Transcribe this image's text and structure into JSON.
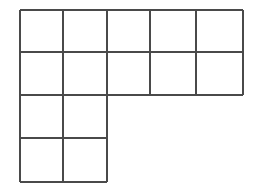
{
  "figure": {
    "shape_name": "L-shaped polyomino grid",
    "background_color": "#ffffff",
    "line_color": "#4a4a4a",
    "line_width": 1.6,
    "canvas": {
      "width": 266,
      "height": 192
    },
    "geometry": {
      "x_positions": [
        20,
        63,
        107,
        150,
        196,
        243
      ],
      "y_positions": [
        10,
        52,
        95,
        138,
        182
      ],
      "cell_width": 43,
      "cell_height": 43,
      "columns": 5,
      "rows": 4,
      "total_cells": 14
    },
    "rows": [
      {
        "index": 1,
        "y_top": 10,
        "y_bottom": 52,
        "columns_filled": 5,
        "x_start": 20,
        "x_end": 243
      },
      {
        "index": 2,
        "y_top": 52,
        "y_bottom": 95,
        "columns_filled": 5,
        "x_start": 20,
        "x_end": 243
      },
      {
        "index": 3,
        "y_top": 95,
        "y_bottom": 138,
        "columns_filled": 2,
        "x_start": 20,
        "x_end": 107
      },
      {
        "index": 4,
        "y_top": 138,
        "y_bottom": 182,
        "columns_filled": 2,
        "x_start": 20,
        "x_end": 107
      }
    ],
    "cells": [
      {
        "id": "r1c1",
        "x": 20,
        "y": 10,
        "w": 43,
        "h": 42
      },
      {
        "id": "r1c2",
        "x": 63,
        "y": 10,
        "w": 44,
        "h": 42
      },
      {
        "id": "r1c3",
        "x": 107,
        "y": 10,
        "w": 43,
        "h": 42
      },
      {
        "id": "r1c4",
        "x": 150,
        "y": 10,
        "w": 46,
        "h": 42
      },
      {
        "id": "r1c5",
        "x": 196,
        "y": 10,
        "w": 47,
        "h": 42
      },
      {
        "id": "r2c1",
        "x": 20,
        "y": 52,
        "w": 43,
        "h": 43
      },
      {
        "id": "r2c2",
        "x": 63,
        "y": 52,
        "w": 44,
        "h": 43
      },
      {
        "id": "r2c3",
        "x": 107,
        "y": 52,
        "w": 43,
        "h": 43
      },
      {
        "id": "r2c4",
        "x": 150,
        "y": 52,
        "w": 46,
        "h": 43
      },
      {
        "id": "r2c5",
        "x": 196,
        "y": 52,
        "w": 47,
        "h": 43
      },
      {
        "id": "r3c1",
        "x": 20,
        "y": 95,
        "w": 43,
        "h": 43
      },
      {
        "id": "r3c2",
        "x": 63,
        "y": 95,
        "w": 44,
        "h": 43
      },
      {
        "id": "r4c1",
        "x": 20,
        "y": 138,
        "w": 43,
        "h": 44
      },
      {
        "id": "r4c2",
        "x": 63,
        "y": 138,
        "w": 44,
        "h": 44
      }
    ],
    "segments": {
      "horizontal": [
        {
          "id": "h-top",
          "x1": 20,
          "x2": 243,
          "y": 10
        },
        {
          "id": "h-row1",
          "x1": 20,
          "x2": 243,
          "y": 52
        },
        {
          "id": "h-row2",
          "x1": 20,
          "x2": 243,
          "y": 95
        },
        {
          "id": "h-row3",
          "x1": 20,
          "x2": 107,
          "y": 138
        },
        {
          "id": "h-bottom",
          "x1": 20,
          "x2": 107,
          "y": 182
        }
      ],
      "vertical": [
        {
          "id": "v-left",
          "x": 20,
          "y1": 10,
          "y2": 182
        },
        {
          "id": "v-c1",
          "x": 63,
          "y1": 10,
          "y2": 182
        },
        {
          "id": "v-c2",
          "x": 107,
          "y1": 10,
          "y2": 182
        },
        {
          "id": "v-c3",
          "x": 150,
          "y1": 10,
          "y2": 95
        },
        {
          "id": "v-c4",
          "x": 196,
          "y1": 10,
          "y2": 95
        },
        {
          "id": "v-right",
          "x": 243,
          "y1": 10,
          "y2": 95
        }
      ]
    }
  }
}
